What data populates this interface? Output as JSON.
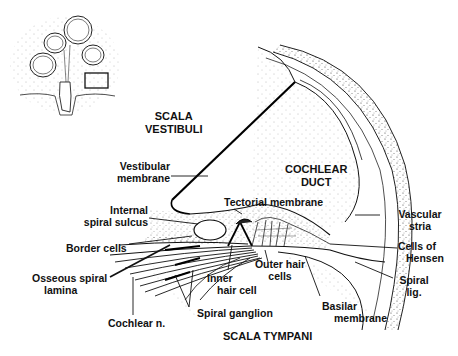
{
  "diagram": {
    "inset": {
      "description": "cochlea overview with boxed region"
    },
    "regions": {
      "scala_vestibuli": [
        "SCALA",
        "VESTIBULI"
      ],
      "cochlear_duct": [
        "COCHLEAR",
        "DUCT"
      ],
      "scala_tympani": "SCALA TYMPANI"
    },
    "labels": {
      "vestibular_membrane": [
        "Vestibular",
        "membrane"
      ],
      "tectorial_membrane": "Tectorial membrane",
      "internal_spiral_sulcus": [
        "Internal",
        "spiral sulcus"
      ],
      "border_cells": "Border cells",
      "osseous_spiral_lamina": [
        "Osseous spiral",
        "lamina"
      ],
      "cochlear_n": "Cochlear n.",
      "spiral_ganglion": "Spiral ganglion",
      "inner_hair_cell": [
        "Inner",
        "hair cell"
      ],
      "outer_hair_cells": [
        "Outer hair",
        "cells"
      ],
      "basilar_membrane": [
        "Basilar",
        "membrane"
      ],
      "vascular_stria": [
        "Vascular",
        "stria"
      ],
      "cells_of_hensen": [
        "Cells of",
        "Hensen"
      ],
      "spiral_lig": [
        "Spiral",
        "lig."
      ]
    }
  }
}
